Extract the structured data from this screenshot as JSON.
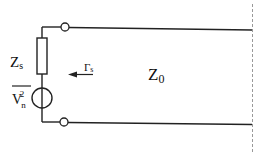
{
  "diagram": {
    "colors": {
      "line": "#222222",
      "dashed": "#999999",
      "background": "#ffffff"
    },
    "labels": {
      "source_impedance": {
        "main": "Z",
        "sub": "s"
      },
      "noise_voltage": {
        "main": "V",
        "sub": "n",
        "sup": "2",
        "overbar": true
      },
      "reflection_coefficient": {
        "main": "Γ",
        "sub": "s"
      },
      "line_impedance": {
        "main": "Z",
        "sub": "0"
      }
    },
    "components": [
      {
        "type": "resistor",
        "name": "source-impedance",
        "label": "Zs"
      },
      {
        "type": "noise-voltage-source",
        "name": "noise-source",
        "label": "Vn² (mean-square)"
      },
      {
        "type": "terminal",
        "name": "top-terminal"
      },
      {
        "type": "terminal",
        "name": "bottom-terminal"
      },
      {
        "type": "transmission-line",
        "name": "line",
        "label": "Z0"
      },
      {
        "type": "arrow",
        "name": "reflection-arrow",
        "direction": "left",
        "label": "Γs"
      },
      {
        "type": "reference-plane",
        "name": "dashed-boundary",
        "style": "dashed"
      }
    ]
  }
}
